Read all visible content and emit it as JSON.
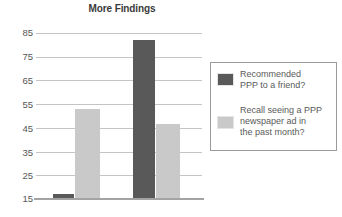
{
  "chart_data": {
    "type": "bar",
    "title": "More Findings",
    "xlabel": "",
    "ylabel": "",
    "ylim": [
      15,
      85
    ],
    "yticks": [
      15,
      25,
      35,
      45,
      55,
      65,
      75,
      85
    ],
    "ytick_labels": [
      "15",
      "25",
      "35",
      "45",
      "55",
      "65",
      "75",
      "85"
    ],
    "categories": [
      "Group 1",
      "Group 2"
    ],
    "xtick_labels": [
      "",
      ""
    ],
    "grid": "horizontal",
    "legend_position": "right",
    "series": [
      {
        "name": "Recommended PPP to a friend?",
        "color": "#595959",
        "values": [
          17,
          82
        ]
      },
      {
        "name": "Recall seeing a PPP newspaper ad in the past month?",
        "color": "#c9c9c9",
        "values": [
          53,
          46.5
        ]
      }
    ]
  },
  "title": {
    "text": "More Findings"
  },
  "axis": {
    "ticks": [
      {
        "label": "85",
        "value": 85
      },
      {
        "label": "75",
        "value": 75
      },
      {
        "label": "65",
        "value": 65
      },
      {
        "label": "55",
        "value": 55
      },
      {
        "label": "45",
        "value": 45
      },
      {
        "label": "35",
        "value": 35
      },
      {
        "label": "25",
        "value": 25
      },
      {
        "label": "15",
        "value": 15
      }
    ]
  },
  "legend": {
    "entries": [
      {
        "swatch": "dark",
        "line1": "Recommended",
        "line2": "PPP to a friend?",
        "line3": ""
      },
      {
        "swatch": "light",
        "line1": "Recall seeing a PPP",
        "line2": "newspaper ad in",
        "line3": "the past month?"
      }
    ]
  },
  "colors": {
    "series_dark": "#595959",
    "series_light": "#c9c9c9",
    "gridline": "#c4c4c4",
    "axis": "#a3a3a3",
    "text": "#5a5a5a",
    "title": "#3a3a3a"
  }
}
